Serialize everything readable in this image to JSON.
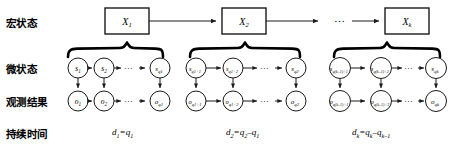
{
  "figure": {
    "type": "hierarchical-hidden-semi-markov-model-diagram",
    "background": "#ffffff",
    "stroke_color": "#1a1a1a"
  },
  "rows": [
    {
      "key": "macro",
      "label": "宏状态",
      "y": 22
    },
    {
      "key": "micro",
      "label": "微状态",
      "y": 68
    },
    {
      "key": "observation",
      "label": "观测结果",
      "y": 101
    },
    {
      "key": "duration",
      "label": "持续时间",
      "y": 133
    }
  ],
  "macro_states": [
    {
      "id": "X1",
      "text": "X",
      "sub": "1",
      "x": 105,
      "y": 8,
      "w": 44,
      "h": 26
    },
    {
      "id": "X2",
      "text": "X",
      "sub": "2",
      "x": 222,
      "y": 8,
      "w": 44,
      "h": 26
    },
    {
      "id": "Xk",
      "text": "X",
      "sub": "k",
      "x": 385,
      "y": 8,
      "w": 44,
      "h": 26
    }
  ],
  "macro_ellipsis": {
    "text": "…",
    "x": 340,
    "y": 20
  },
  "micro_groups": [
    {
      "id": "group1",
      "brace_from": 68,
      "brace_to": 163,
      "brace_tip_x": 127,
      "states": [
        {
          "id": "s1",
          "text": "s",
          "sub": "1",
          "cx": 78,
          "cy": 68
        },
        {
          "id": "s2",
          "text": "s",
          "sub": "2",
          "cx": 104,
          "cy": 68
        },
        {
          "id": "sq1",
          "text": "s",
          "sub": "q1",
          "cx": 160,
          "cy": 68
        }
      ],
      "inner_ellipsis": {
        "text": "…",
        "x": 130,
        "y": 68
      },
      "observations": [
        {
          "id": "o1",
          "text": "o",
          "sub": "1",
          "cx": 78,
          "cy": 101
        },
        {
          "id": "o2",
          "text": "o",
          "sub": "2",
          "cx": 104,
          "cy": 101
        },
        {
          "id": "oq1",
          "text": "o",
          "sub": "q1",
          "cx": 160,
          "cy": 101
        }
      ],
      "obs_ellipsis": {
        "text": "…",
        "x": 130,
        "y": 101
      },
      "duration": {
        "id": "d1",
        "text": "d₁=q₁",
        "x": 143,
        "y": 133
      }
    },
    {
      "id": "group2",
      "brace_from": 190,
      "brace_to": 300,
      "brace_tip_x": 245,
      "states": [
        {
          "id": "sq1p1",
          "text": "s",
          "sub": "q1+1",
          "cx": 196,
          "cy": 68
        },
        {
          "id": "sq1p2",
          "text": "s",
          "sub": "q1+2",
          "cx": 233,
          "cy": 68
        },
        {
          "id": "sq2",
          "text": "s",
          "sub": "q2",
          "cx": 296,
          "cy": 68
        }
      ],
      "inner_ellipsis": {
        "text": "…",
        "x": 266,
        "y": 68
      },
      "observations": [
        {
          "id": "oq1p1",
          "text": "o",
          "sub": "q1+1",
          "cx": 196,
          "cy": 101
        },
        {
          "id": "oq1p2",
          "text": "o",
          "sub": "q1+2",
          "cx": 233,
          "cy": 101
        },
        {
          "id": "oq2",
          "text": "o",
          "sub": "q2",
          "cx": 296,
          "cy": 101
        }
      ],
      "obs_ellipsis": {
        "text": "…",
        "x": 266,
        "y": 101
      },
      "duration": {
        "id": "d2",
        "text": "d₂=q₂–q₁",
        "x": 264,
        "y": 133
      }
    },
    {
      "id": "groupk",
      "brace_from": 334,
      "brace_to": 440,
      "brace_tip_x": 387,
      "states": [
        {
          "id": "sqk1p1",
          "text": "s",
          "sub": "q(k–1)+1",
          "cx": 340,
          "cy": 68
        },
        {
          "id": "sqk1p2",
          "text": "s",
          "sub": "q(k–1)+2",
          "cx": 381,
          "cy": 68
        },
        {
          "id": "sqk",
          "text": "s",
          "sub": "qk",
          "cx": 436,
          "cy": 68
        }
      ],
      "inner_ellipsis": {
        "text": "…",
        "x": 410,
        "y": 68
      },
      "observations": [
        {
          "id": "oqk1p1",
          "text": "o",
          "sub": "q(k–1)+1",
          "cx": 340,
          "cy": 101
        },
        {
          "id": "oqk1p2",
          "text": "o",
          "sub": "q(k–1)+2",
          "cx": 381,
          "cy": 101
        },
        {
          "id": "oqk",
          "text": "o",
          "sub": "qk",
          "cx": 436,
          "cy": 101
        }
      ],
      "obs_ellipsis": {
        "text": "…",
        "x": 410,
        "y": 101
      },
      "duration": {
        "id": "dk",
        "text": "dk=qk–qk–1",
        "x": 390,
        "y": 133
      }
    }
  ],
  "duration_labels": [
    {
      "id": "d1",
      "main": "d",
      "sub1": "1",
      "eq": "=",
      "term": "q",
      "sub2": "1"
    },
    {
      "id": "d2",
      "main": "d",
      "sub1": "2",
      "eq": "=",
      "term": "q",
      "sub2": "2",
      "minus": "–",
      "term2": "q",
      "sub3": "1"
    },
    {
      "id": "dk",
      "main": "d",
      "sub1": "k",
      "eq": "=",
      "term": "q",
      "sub2": "k",
      "minus": "–",
      "term2": "q",
      "sub3": "k–1"
    }
  ]
}
